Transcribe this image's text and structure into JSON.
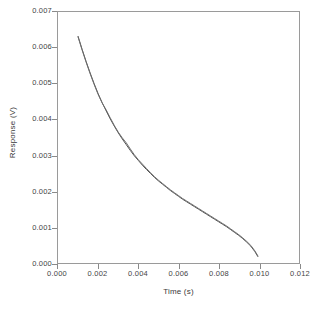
{
  "chart_data": {
    "type": "line",
    "title": "",
    "xlabel": "Time (s)",
    "ylabel": "Response (V)",
    "xlim": [
      0.0,
      0.012
    ],
    "ylim": [
      0.0,
      0.007
    ],
    "xticks": [
      "0.000",
      "0.002",
      "0.004",
      "0.006",
      "0.008",
      "0.010",
      "0.012"
    ],
    "xtick_values": [
      0.0,
      0.002,
      0.004,
      0.006,
      0.008,
      0.01,
      0.012
    ],
    "yticks": [
      "0.000",
      "0.001",
      "0.002",
      "0.003",
      "0.004",
      "0.005",
      "0.006",
      "0.007"
    ],
    "ytick_values": [
      0.0,
      0.001,
      0.002,
      0.003,
      0.004,
      0.005,
      0.006,
      0.007
    ],
    "grid": false,
    "legend": null,
    "legend_position": "none",
    "frame": "full-box",
    "tick_direction": "out",
    "series": [
      {
        "name": "measured",
        "color": "#4d4d4d",
        "style": "solid",
        "x": [
          0.001,
          0.0012,
          0.0014,
          0.0016,
          0.0018,
          0.002,
          0.0022,
          0.0024,
          0.0026,
          0.0028,
          0.003,
          0.0032,
          0.0034,
          0.0036,
          0.0038,
          0.004,
          0.0042,
          0.0044,
          0.0046,
          0.0048,
          0.005,
          0.0052,
          0.0054,
          0.0056,
          0.0058,
          0.006,
          0.0062,
          0.0064,
          0.0066,
          0.0068,
          0.007,
          0.0072,
          0.0074,
          0.0076,
          0.0078,
          0.008,
          0.0082,
          0.0084,
          0.0086,
          0.0088,
          0.009,
          0.0092,
          0.0094,
          0.0096,
          0.0098,
          0.00995
        ],
        "y": [
          0.00632,
          0.00596,
          0.00562,
          0.0053,
          0.005,
          0.00472,
          0.00447,
          0.00424,
          0.00402,
          0.00382,
          0.00363,
          0.00346,
          0.0033,
          0.00314,
          0.00299,
          0.00286,
          0.00273,
          0.00261,
          0.0025,
          0.00239,
          0.00229,
          0.0022,
          0.00211,
          0.00202,
          0.00194,
          0.00186,
          0.00178,
          0.00171,
          0.00164,
          0.00157,
          0.0015,
          0.00143,
          0.00136,
          0.00129,
          0.00122,
          0.00115,
          0.00108,
          0.00101,
          0.00093,
          0.00085,
          0.00077,
          0.00068,
          0.00058,
          0.00047,
          0.00032,
          0.00018
        ]
      },
      {
        "name": "fitted",
        "color": "#6e6e6e",
        "style": "solid",
        "x": [
          0.001,
          0.0012,
          0.0014,
          0.0016,
          0.0018,
          0.002,
          0.0022,
          0.0024,
          0.0026,
          0.0028,
          0.003,
          0.0032,
          0.0034,
          0.0036,
          0.0038,
          0.004,
          0.0042,
          0.0044,
          0.0046,
          0.0048,
          0.005,
          0.0052,
          0.0054,
          0.0056,
          0.0058,
          0.006,
          0.0062,
          0.0064,
          0.0066,
          0.0068,
          0.007,
          0.0072,
          0.0074,
          0.0076,
          0.0078,
          0.008,
          0.0082,
          0.0084,
          0.0086,
          0.0088,
          0.009,
          0.0092,
          0.0094,
          0.0096,
          0.0098,
          0.00995
        ],
        "y": [
          0.0063,
          0.00594,
          0.0056,
          0.00528,
          0.00498,
          0.0047,
          0.00446,
          0.00427,
          0.00405,
          0.00384,
          0.00365,
          0.00349,
          0.00335,
          0.00318,
          0.00302,
          0.00288,
          0.00276,
          0.00264,
          0.00252,
          0.00241,
          0.00231,
          0.00222,
          0.00213,
          0.00204,
          0.00196,
          0.00188,
          0.0018,
          0.00173,
          0.00166,
          0.00159,
          0.00152,
          0.00145,
          0.00138,
          0.00131,
          0.00124,
          0.00117,
          0.0011,
          0.00103,
          0.00095,
          0.00087,
          0.00079,
          0.0007,
          0.0006,
          0.00049,
          0.00034,
          0.0002
        ]
      }
    ]
  }
}
